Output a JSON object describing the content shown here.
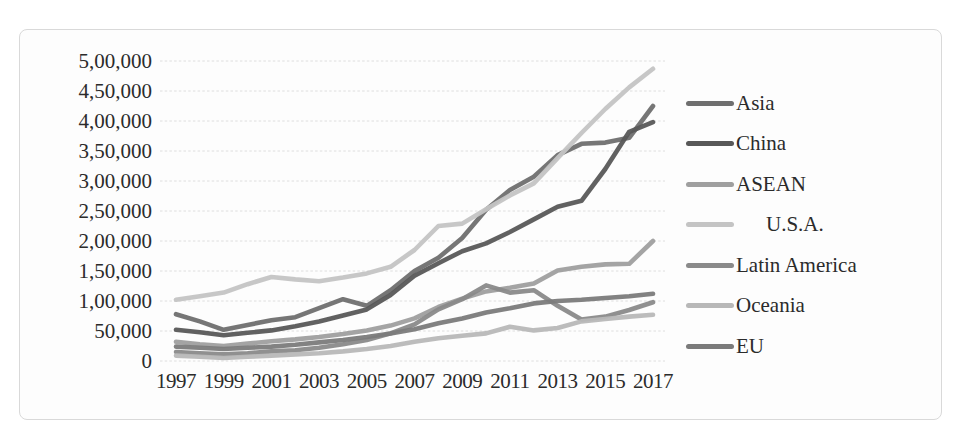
{
  "figure": {
    "background": "#fdfdfd",
    "border_color": "#d9d9d9"
  },
  "chart_data": {
    "type": "line",
    "title": "",
    "xlabel": "",
    "ylabel": "",
    "x": [
      1997,
      1998,
      1999,
      2000,
      2001,
      2002,
      2003,
      2004,
      2005,
      2006,
      2007,
      2008,
      2009,
      2010,
      2011,
      2012,
      2013,
      2014,
      2015,
      2016,
      2017
    ],
    "x_tick_labels": [
      "1997",
      "1999",
      "2001",
      "2003",
      "2005",
      "2007",
      "2009",
      "2011",
      "2013",
      "2015",
      "2017"
    ],
    "y_tick_labels": [
      "0",
      "50,000",
      "1,00,000",
      "1,50,000",
      "2,00,000",
      "2,50,000",
      "3,00,000",
      "3,50,000",
      "4,00,000",
      "4,50,000",
      "5,00,000"
    ],
    "ylim": [
      0,
      500000
    ],
    "y_tick_step": 50000,
    "grid": "horizontal-light-dotted",
    "legend_position": "right",
    "number_format": "Indian lakh comma grouping",
    "series": [
      {
        "name": "Asia",
        "color": "#6f6f6f",
        "values": [
          78000,
          66000,
          52000,
          60000,
          68000,
          73000,
          88000,
          103000,
          92000,
          118000,
          150000,
          172000,
          205000,
          252000,
          285000,
          307000,
          343000,
          362000,
          364000,
          372000,
          425000
        ]
      },
      {
        "name": "China",
        "color": "#585858",
        "values": [
          52000,
          48000,
          43000,
          47000,
          51000,
          58000,
          66000,
          76000,
          86000,
          110000,
          142000,
          163000,
          183000,
          196000,
          215000,
          236000,
          257000,
          267000,
          320000,
          382000,
          398000
        ]
      },
      {
        "name": "ASEAN",
        "color": "#9f9f9f",
        "values": [
          32000,
          28000,
          25000,
          29000,
          33000,
          36000,
          40000,
          45000,
          51000,
          59000,
          71000,
          90000,
          104000,
          116000,
          122000,
          129000,
          151000,
          157000,
          161000,
          162000,
          200000
        ]
      },
      {
        "name": "U.S.A.",
        "color": "#c4c4c4",
        "indent": true,
        "values": [
          102000,
          108000,
          114000,
          128000,
          140000,
          136000,
          133000,
          139000,
          146000,
          157000,
          185000,
          225000,
          229000,
          253000,
          276000,
          296000,
          338000,
          380000,
          420000,
          456000,
          487000
        ]
      },
      {
        "name": "Latin America",
        "color": "#8a8a8a",
        "values": [
          15000,
          13000,
          11000,
          13000,
          16000,
          18000,
          22000,
          28000,
          35000,
          46000,
          61000,
          86000,
          103000,
          126000,
          114000,
          118000,
          92000,
          69000,
          74000,
          85000,
          98000
        ]
      },
      {
        "name": "Oceania",
        "color": "#b8b8b8",
        "values": [
          9000,
          7000,
          5000,
          7000,
          9000,
          11000,
          13000,
          16000,
          20000,
          25000,
          32000,
          38000,
          42000,
          46000,
          57000,
          51000,
          55000,
          66000,
          70000,
          74000,
          77000
        ]
      },
      {
        "name": "EU",
        "color": "#7b7b7b",
        "values": [
          24000,
          22000,
          20000,
          22000,
          24000,
          27000,
          31000,
          35000,
          40000,
          46000,
          53000,
          63000,
          71000,
          81000,
          88000,
          96000,
          100000,
          102000,
          105000,
          108000,
          112000
        ]
      }
    ]
  }
}
